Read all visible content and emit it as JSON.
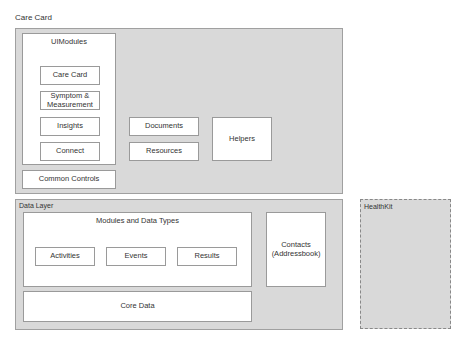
{
  "title": "Care Card",
  "care_card": {
    "ui_modules": {
      "label": "UIModules",
      "items": [
        "Care Card",
        "Symptom & Measurement",
        "Insights",
        "Connect"
      ]
    },
    "common_controls": "Common Controls",
    "documents": "Documents",
    "resources": "Resources",
    "helpers": "Helpers"
  },
  "data_layer": {
    "label": "Data Layer",
    "modules": {
      "label": "Modules and Data Types",
      "items": [
        "Activities",
        "Events",
        "Results"
      ]
    },
    "core_data": "Core Data",
    "contacts": "Contacts (Addressbook)"
  },
  "healthkit": "HealthKit"
}
